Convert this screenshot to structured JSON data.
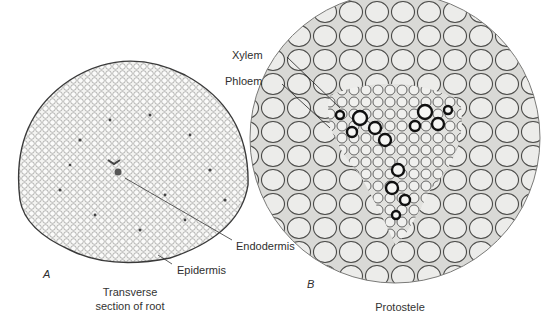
{
  "figure": {
    "panel_a": {
      "letter": "A",
      "caption_line1": "Transverse",
      "caption_line2": "section of root",
      "labels": {
        "endodermis": "Endodermis",
        "epidermis": "Epidermis"
      }
    },
    "panel_b": {
      "letter": "B",
      "caption": "Protostele",
      "labels": {
        "xylem": "Xylem",
        "phloem": "Phloem"
      }
    }
  }
}
